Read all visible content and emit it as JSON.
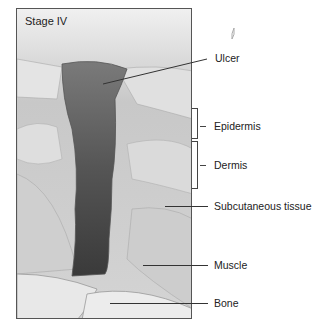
{
  "figure": {
    "stage_title": "Stage IV",
    "labels": {
      "ulcer": "Ulcer",
      "epidermis": "Epidermis",
      "dermis": "Dermis",
      "subcutaneous": "Subcutaneous tissue",
      "muscle": "Muscle",
      "bone": "Bone"
    },
    "colors": {
      "frame_border": "#555555",
      "ulcer_dark": "#4a4a4a",
      "skin": "#dcdcdc",
      "bone": "#e8e8e8",
      "text": "#222222"
    }
  }
}
